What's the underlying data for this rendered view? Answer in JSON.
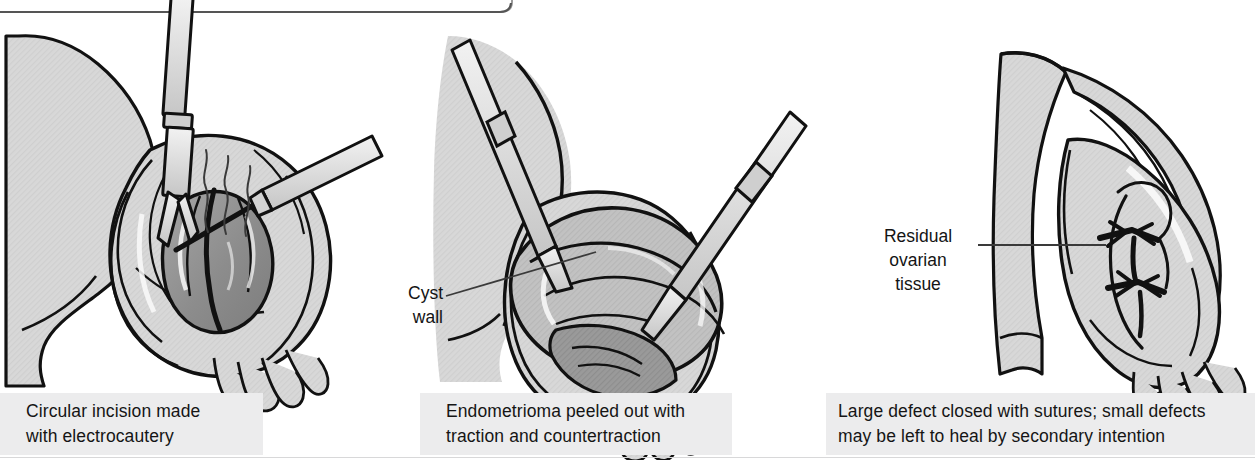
{
  "figure": {
    "panel_count": 3,
    "style": "grayscale medical line illustration"
  },
  "colors": {
    "background": "#ffffff",
    "tissue_light": "#d6d6d6",
    "tissue_mid": "#bdbdbd",
    "tissue_dark": "#9b9b9b",
    "cyst_dark": "#8d8d8d",
    "instrument": "#e2e2e2",
    "outline": "#111111",
    "caption_band": "#ececed",
    "text": "#151515",
    "leader_line": "#3a3a3a"
  },
  "top_box": {
    "name": "cut-off-rounded-box",
    "visible_edge": "bottom edge with rounded right corner",
    "right_edge_x": 512,
    "bottom_edge_y": 12
  },
  "panels": [
    {
      "index": 1,
      "caption": "Circular incision made\nwith electrocautery",
      "elements": [
        "uterus body (cut off at left edge)",
        "ovary with endometrioma",
        "dark endometrioma cyst",
        "grasping forceps (vertical)",
        "electrocautery probe (upper right)",
        "smoke wisps",
        "fimbriae"
      ]
    },
    {
      "index": 2,
      "caption": "Endometrioma peeled out with\ntraction and countertraction",
      "label": "Cyst\nwall",
      "elements": [
        "uterus body",
        "ovary",
        "peeled cyst wall",
        "left grasping forceps",
        "right grasping forceps",
        "fimbriae"
      ]
    },
    {
      "index": 3,
      "caption": "Large defect closed with sutures; small defects\nmay be left to heal by secondary intention",
      "label": "Residual\novarian\ntissue",
      "elements": [
        "uterus body",
        "fallopian tube arching over ovary",
        "ovary with closed defect",
        "suture knots",
        "fimbriae"
      ]
    }
  ],
  "callouts": [
    {
      "id": "cyst-wall",
      "text": "Cyst\nwall",
      "panel": 2,
      "leader": "diagonal up-right"
    },
    {
      "id": "residual-ovarian-tissue",
      "text": "Residual\novarian\ntissue",
      "panel": 3,
      "leader": "horizontal right"
    }
  ]
}
